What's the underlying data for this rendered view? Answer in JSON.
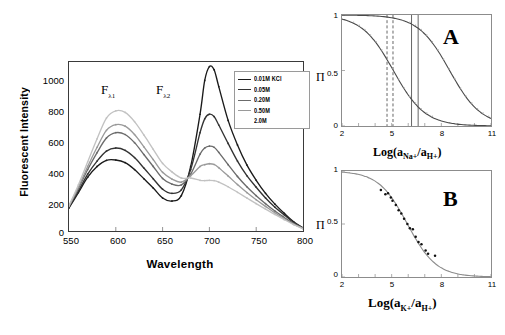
{
  "figure": {
    "panels": [
      "spectrum",
      "A",
      "B"
    ]
  },
  "spectrum": {
    "ylabel": "Fluorescent Intensity",
    "xlabel": "Wavelength",
    "yticks": [
      "0",
      "200",
      "400",
      "600",
      "800",
      "1000"
    ],
    "xticks": [
      "550",
      "600",
      "650",
      "700",
      "750",
      "800"
    ],
    "annotations": [
      {
        "text": "F",
        "sub": "λ1",
        "name": "f-lambda-1-annotation"
      },
      {
        "text": "F",
        "sub": "λ2",
        "name": "f-lambda-2-annotation"
      }
    ],
    "legend": {
      "items": [
        {
          "label": "0.01M KCl",
          "color": "#1a1a1a"
        },
        {
          "label": "0.05M",
          "color": "#333333"
        },
        {
          "label": "0.20M",
          "color": "#6b6b6b"
        },
        {
          "label": "0.50M",
          "color": "#9a9a9a"
        },
        {
          "label": "2.0M",
          "color": "#c2c2c2"
        }
      ]
    }
  },
  "chart_data": [
    {
      "type": "line",
      "id": "spectrum",
      "title": "",
      "xlabel": "Wavelength",
      "ylabel": "Fluorescent Intensity",
      "xlim": [
        550,
        800
      ],
      "ylim": [
        0,
        1100
      ],
      "grid": false,
      "legend_position": "top-right",
      "x": [
        550,
        560,
        570,
        580,
        590,
        600,
        610,
        620,
        630,
        640,
        650,
        660,
        670,
        680,
        690,
        695,
        700,
        705,
        710,
        720,
        730,
        740,
        750,
        760,
        770,
        780,
        790,
        800
      ],
      "series": [
        {
          "name": "0.01M KCl",
          "color": "#1a1a1a",
          "values": [
            150,
            250,
            350,
            420,
            460,
            462,
            445,
            400,
            340,
            280,
            215,
            195,
            230,
            420,
            760,
            980,
            1070,
            1050,
            940,
            720,
            560,
            430,
            330,
            245,
            175,
            115,
            60,
            20
          ]
        },
        {
          "name": "0.05M",
          "color": "#333333",
          "values": [
            155,
            260,
            370,
            455,
            520,
            540,
            525,
            478,
            410,
            340,
            272,
            245,
            268,
            400,
            640,
            730,
            760,
            745,
            690,
            570,
            455,
            360,
            285,
            215,
            155,
            105,
            55,
            20
          ]
        },
        {
          "name": "0.20M",
          "color": "#6b6b6b",
          "values": [
            160,
            275,
            400,
            510,
            605,
            640,
            628,
            575,
            498,
            420,
            342,
            305,
            300,
            370,
            500,
            540,
            552,
            545,
            512,
            432,
            355,
            288,
            230,
            178,
            130,
            88,
            48,
            18
          ]
        },
        {
          "name": "0.50M",
          "color": "#9a9a9a",
          "values": [
            162,
            285,
            420,
            545,
            655,
            692,
            682,
            628,
            548,
            465,
            382,
            338,
            318,
            360,
            420,
            432,
            438,
            433,
            412,
            358,
            302,
            250,
            203,
            160,
            118,
            80,
            44,
            16
          ]
        },
        {
          "name": "2.0M",
          "color": "#c2c2c2",
          "values": [
            165,
            300,
            450,
            600,
            735,
            782,
            772,
            712,
            625,
            532,
            440,
            385,
            345,
            345,
            330,
            328,
            330,
            328,
            318,
            288,
            252,
            215,
            178,
            142,
            108,
            74,
            42,
            15
          ]
        }
      ]
    },
    {
      "type": "line",
      "id": "A",
      "panel_label": "A",
      "xlabel": "Log(a_Na+/a_H+)",
      "ylabel": "Π",
      "xlim": [
        2,
        11
      ],
      "ylim": [
        0,
        1
      ],
      "xticks": [
        "2",
        "5",
        "8",
        "11"
      ],
      "yticks": [
        "0",
        "0.5",
        "1"
      ],
      "grid": false,
      "series": [
        {
          "name": "left-curve",
          "midpoint": 5.1,
          "slope": 1.05,
          "color": "#4a4a4a"
        },
        {
          "name": "right-curve",
          "midpoint": 8.5,
          "slope": 1.05,
          "color": "#4a4a4a"
        }
      ],
      "markers": [
        {
          "name": "dashed-line-1",
          "x": 4.72,
          "style": "dashed"
        },
        {
          "name": "dashed-line-2",
          "x": 5.08,
          "style": "dashed"
        },
        {
          "name": "solid-line-1",
          "x": 6.2,
          "style": "solid"
        },
        {
          "name": "solid-line-2",
          "x": 6.6,
          "style": "solid"
        }
      ]
    },
    {
      "type": "scatter",
      "id": "B",
      "panel_label": "B",
      "xlabel": "Log(a_K+/a_H+)",
      "ylabel": "Π",
      "xlim": [
        2,
        11
      ],
      "ylim": [
        0,
        1
      ],
      "xticks": [
        "2",
        "5",
        "8",
        "11"
      ],
      "yticks": [
        "0",
        "0.5",
        "1"
      ],
      "grid": false,
      "fit_curve": {
        "midpoint": 5.95,
        "slope": 1.15,
        "color": "#8c8c8c"
      },
      "points": [
        {
          "x": 4.35,
          "y": 0.82
        },
        {
          "x": 4.62,
          "y": 0.78
        },
        {
          "x": 4.78,
          "y": 0.79
        },
        {
          "x": 4.95,
          "y": 0.75
        },
        {
          "x": 5.05,
          "y": 0.72
        },
        {
          "x": 5.25,
          "y": 0.68
        },
        {
          "x": 5.42,
          "y": 0.63
        },
        {
          "x": 5.58,
          "y": 0.6
        },
        {
          "x": 5.75,
          "y": 0.55
        },
        {
          "x": 5.95,
          "y": 0.5
        },
        {
          "x": 6.1,
          "y": 0.46
        },
        {
          "x": 6.28,
          "y": 0.45
        },
        {
          "x": 6.45,
          "y": 0.38
        },
        {
          "x": 6.62,
          "y": 0.33
        },
        {
          "x": 6.8,
          "y": 0.31
        },
        {
          "x": 7.05,
          "y": 0.25
        },
        {
          "x": 7.2,
          "y": 0.22
        },
        {
          "x": 7.62,
          "y": 0.2
        }
      ]
    }
  ],
  "panel_a": {
    "label": "A",
    "ylabel": "Π",
    "xlabel_main": "Log(a",
    "xlabel_sub1": "Na+",
    "xlabel_mid": "/a",
    "xlabel_sub2": "H+",
    "xlabel_end": ")",
    "xticks": [
      "2",
      "5",
      "8",
      "11"
    ],
    "yticks": [
      "0",
      "0.5",
      "1"
    ]
  },
  "panel_b": {
    "label": "B",
    "ylabel": "Π",
    "xlabel_main": "Log(a",
    "xlabel_sub1": "K+",
    "xlabel_mid": "/a",
    "xlabel_sub2": "H+",
    "xlabel_end": ")",
    "xticks": [
      "2",
      "5",
      "8",
      "11"
    ],
    "yticks": [
      "0",
      "0.5",
      "1"
    ]
  }
}
